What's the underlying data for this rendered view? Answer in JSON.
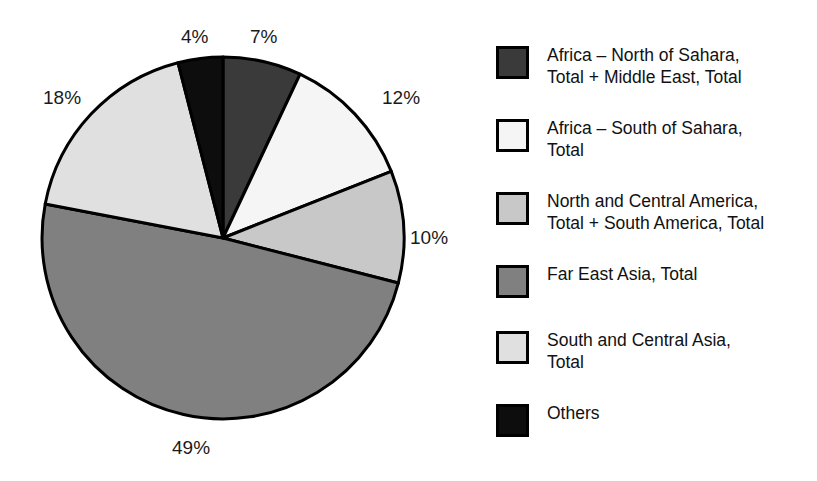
{
  "chart_data": {
    "type": "pie",
    "title": "",
    "subtitle": "",
    "xlabel": "",
    "ylabel": "",
    "legend_position": "right",
    "grid": false,
    "start_angle_deg": 0,
    "direction": "clockwise",
    "center": {
      "x": 223,
      "y": 238
    },
    "radius": 181,
    "categories": [
      "Africa – North of Sahara, Total + Middle East, Total",
      "Africa – South of Sahara, Total",
      "North and Central America, Total + South America, Total",
      "Far East Asia, Total",
      "South and Central Asia, Total",
      "Others"
    ],
    "values": [
      7,
      12,
      10,
      49,
      18,
      4
    ],
    "value_labels": [
      "7%",
      "12%",
      "10%",
      "49%",
      "18%",
      "4%"
    ],
    "colors": [
      "#3a3a3a",
      "#f5f5f5",
      "#c8c8c8",
      "#808080",
      "#e0e0e0",
      "#0d0d0d"
    ],
    "slice_border_color": "#000000",
    "slices": [
      {
        "label": "Africa – North of Sahara, Total + Middle East, Total",
        "value": 7,
        "value_label": "7%",
        "color": "#3a3a3a",
        "label_x": 250,
        "label_y": 27
      },
      {
        "label": "Africa – South of Sahara, Total",
        "value": 12,
        "value_label": "12%",
        "color": "#f5f5f5",
        "label_x": 382,
        "label_y": 88
      },
      {
        "label": "North and Central America, Total + South America, Total",
        "value": 10,
        "value_label": "10%",
        "color": "#c8c8c8",
        "label_x": 410,
        "label_y": 228
      },
      {
        "label": "Far East Asia, Total",
        "value": 49,
        "value_label": "49%",
        "color": "#808080",
        "label_x": 172,
        "label_y": 438
      },
      {
        "label": "South and Central Asia, Total",
        "value": 18,
        "value_label": "18%",
        "color": "#e0e0e0",
        "label_x": 43,
        "label_y": 88
      },
      {
        "label": "Others",
        "value": 4,
        "value_label": "4%",
        "color": "#0d0d0d",
        "label_x": 181,
        "label_y": 27
      }
    ]
  },
  "legend": {
    "items": [
      {
        "label": "Africa – North of Sahara,\nTotal + Middle East, Total",
        "color": "#3a3a3a",
        "top": 0
      },
      {
        "label": "Africa – South of Sahara,\nTotal",
        "color": "#f5f5f5",
        "top": 73
      },
      {
        "label": "North and Central America,\nTotal + South America, Total",
        "color": "#c8c8c8",
        "top": 146
      },
      {
        "label": "Far East Asia, Total",
        "color": "#808080",
        "top": 219
      },
      {
        "label": "South and Central Asia,\nTotal",
        "color": "#e0e0e0",
        "top": 285
      },
      {
        "label": "Others",
        "color": "#0d0d0d",
        "top": 358
      }
    ]
  }
}
